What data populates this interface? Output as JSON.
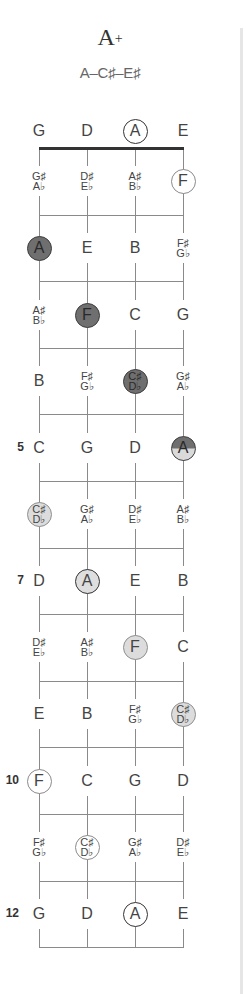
{
  "chord": {
    "name": "A",
    "symbol": "+",
    "notes_label": "A–C♯–E♯"
  },
  "strings": [
    "G",
    "D",
    "A",
    "E"
  ],
  "open_strings": [
    {
      "label": "G",
      "style": "plain"
    },
    {
      "label": "D",
      "style": "plain"
    },
    {
      "label": "A",
      "style": "open-dark"
    },
    {
      "label": "E",
      "style": "plain"
    }
  ],
  "fret_numbers": [
    {
      "fret": 5,
      "label": "5"
    },
    {
      "fret": 7,
      "label": "7"
    },
    {
      "fret": 10,
      "label": "10"
    },
    {
      "fret": 12,
      "label": "12"
    }
  ],
  "frets": [
    {
      "fret": 1,
      "cells": [
        {
          "top": "G♯",
          "bottom": "A♭",
          "style": "plain"
        },
        {
          "top": "D♯",
          "bottom": "E♭",
          "style": "plain"
        },
        {
          "top": "A♯",
          "bottom": "B♭",
          "style": "plain"
        },
        {
          "label": "F",
          "style": "open"
        }
      ]
    },
    {
      "fret": 2,
      "cells": [
        {
          "label": "A",
          "style": "dark"
        },
        {
          "label": "E",
          "style": "plain"
        },
        {
          "label": "B",
          "style": "plain"
        },
        {
          "top": "F♯",
          "bottom": "G♭",
          "style": "plain"
        }
      ]
    },
    {
      "fret": 3,
      "cells": [
        {
          "top": "A♯",
          "bottom": "B♭",
          "style": "plain"
        },
        {
          "label": "F",
          "style": "dark"
        },
        {
          "label": "C",
          "style": "plain"
        },
        {
          "label": "G",
          "style": "plain"
        }
      ]
    },
    {
      "fret": 4,
      "cells": [
        {
          "label": "B",
          "style": "plain"
        },
        {
          "top": "F♯",
          "bottom": "G♭",
          "style": "plain"
        },
        {
          "top": "C♯",
          "bottom": "D♭",
          "style": "dark"
        },
        {
          "top": "G♯",
          "bottom": "A♭",
          "style": "plain"
        }
      ]
    },
    {
      "fret": 5,
      "cells": [
        {
          "label": "C",
          "style": "plain"
        },
        {
          "label": "G",
          "style": "plain"
        },
        {
          "label": "D",
          "style": "plain"
        },
        {
          "label": "A",
          "style": "split"
        }
      ]
    },
    {
      "fret": 6,
      "cells": [
        {
          "top": "C♯",
          "bottom": "D♭",
          "style": "light"
        },
        {
          "top": "G♯",
          "bottom": "A♭",
          "style": "plain"
        },
        {
          "top": "D♯",
          "bottom": "E♭",
          "style": "plain"
        },
        {
          "top": "A♯",
          "bottom": "B♭",
          "style": "plain"
        }
      ]
    },
    {
      "fret": 7,
      "cells": [
        {
          "label": "D",
          "style": "plain"
        },
        {
          "label": "A",
          "style": "light-bold"
        },
        {
          "label": "E",
          "style": "plain"
        },
        {
          "label": "B",
          "style": "plain"
        }
      ]
    },
    {
      "fret": 8,
      "cells": [
        {
          "top": "D♯",
          "bottom": "E♭",
          "style": "plain"
        },
        {
          "top": "A♯",
          "bottom": "B♭",
          "style": "plain"
        },
        {
          "label": "F",
          "style": "light"
        },
        {
          "label": "C",
          "style": "plain"
        }
      ]
    },
    {
      "fret": 9,
      "cells": [
        {
          "label": "E",
          "style": "plain"
        },
        {
          "label": "B",
          "style": "plain"
        },
        {
          "top": "F♯",
          "bottom": "G♭",
          "style": "plain"
        },
        {
          "top": "C♯",
          "bottom": "D♭",
          "style": "light"
        }
      ]
    },
    {
      "fret": 10,
      "cells": [
        {
          "label": "F",
          "style": "open"
        },
        {
          "label": "C",
          "style": "plain"
        },
        {
          "label": "G",
          "style": "plain"
        },
        {
          "label": "D",
          "style": "plain"
        }
      ]
    },
    {
      "fret": 11,
      "cells": [
        {
          "top": "F♯",
          "bottom": "G♭",
          "style": "plain"
        },
        {
          "top": "C♯",
          "bottom": "D♭",
          "style": "open"
        },
        {
          "top": "G♯",
          "bottom": "A♭",
          "style": "plain"
        },
        {
          "top": "D♯",
          "bottom": "E♭",
          "style": "plain"
        }
      ]
    },
    {
      "fret": 12,
      "cells": [
        {
          "label": "G",
          "style": "plain"
        },
        {
          "label": "D",
          "style": "plain"
        },
        {
          "label": "A",
          "style": "open-dark"
        },
        {
          "label": "E",
          "style": "plain"
        }
      ]
    }
  ],
  "colors": {
    "dark_fill": "#6f6f6f",
    "light_fill": "#dcdcdc",
    "line": "#8a8a8a",
    "nut": "#333333"
  }
}
